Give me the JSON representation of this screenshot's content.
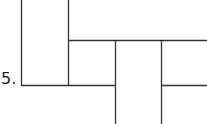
{
  "problem": {
    "number_label": "5."
  },
  "figure": {
    "stroke_color": "#333333",
    "squares": 6
  }
}
